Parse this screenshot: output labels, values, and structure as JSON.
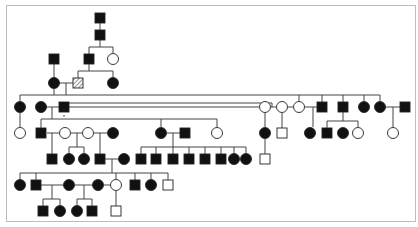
{
  "diagram": {
    "type": "pedigree",
    "colors": {
      "affected": "#111111",
      "unaffected_fill": "#ffffff",
      "line": "#444444",
      "frame": "#bdbdbd",
      "carrier_hatch": "#777777"
    },
    "legend_marker": "*",
    "individuals": [
      {
        "id": "a1",
        "shape": "square",
        "status": "affected",
        "x": 100,
        "y": 18
      },
      {
        "id": "a2",
        "shape": "square",
        "status": "affected",
        "x": 100,
        "y": 35
      },
      {
        "id": "b1",
        "shape": "square",
        "status": "affected",
        "x": 54,
        "y": 59
      },
      {
        "id": "b2",
        "shape": "square",
        "status": "affected",
        "x": 89,
        "y": 59
      },
      {
        "id": "b3",
        "shape": "circle",
        "status": "unaffected",
        "x": 113,
        "y": 59
      },
      {
        "id": "c1",
        "shape": "circle",
        "status": "affected",
        "x": 54,
        "y": 83
      },
      {
        "id": "c2",
        "shape": "square",
        "status": "carrier",
        "x": 78,
        "y": 83
      },
      {
        "id": "c3",
        "shape": "circle",
        "status": "affected",
        "x": 113,
        "y": 83
      },
      {
        "id": "d1",
        "shape": "circle",
        "status": "affected",
        "x": 20,
        "y": 107
      },
      {
        "id": "d2",
        "shape": "circle",
        "status": "affected",
        "x": 41,
        "y": 107
      },
      {
        "id": "d3",
        "shape": "square",
        "status": "affected",
        "x": 64,
        "y": 107,
        "marker": "*"
      },
      {
        "id": "d4",
        "shape": "circle",
        "status": "unaffected",
        "x": 265,
        "y": 107
      },
      {
        "id": "d5",
        "shape": "circle",
        "status": "unaffected",
        "x": 282,
        "y": 107
      },
      {
        "id": "d6",
        "shape": "circle",
        "status": "unaffected",
        "x": 299,
        "y": 107
      },
      {
        "id": "d7",
        "shape": "square",
        "status": "affected",
        "x": 322,
        "y": 107
      },
      {
        "id": "d8",
        "shape": "square",
        "status": "affected",
        "x": 343,
        "y": 107
      },
      {
        "id": "d9",
        "shape": "circle",
        "status": "affected",
        "x": 364,
        "y": 107
      },
      {
        "id": "d10",
        "shape": "circle",
        "status": "affected",
        "x": 380,
        "y": 107
      },
      {
        "id": "d11",
        "shape": "square",
        "status": "affected",
        "x": 405,
        "y": 107
      },
      {
        "id": "e1",
        "shape": "circle",
        "status": "unaffected",
        "x": 20,
        "y": 133
      },
      {
        "id": "e2",
        "shape": "square",
        "status": "affected",
        "x": 41,
        "y": 133
      },
      {
        "id": "e3",
        "shape": "circle",
        "status": "unaffected",
        "x": 65,
        "y": 133
      },
      {
        "id": "e4",
        "shape": "circle",
        "status": "unaffected",
        "x": 88,
        "y": 133
      },
      {
        "id": "e5",
        "shape": "circle",
        "status": "affected",
        "x": 113,
        "y": 133
      },
      {
        "id": "e6",
        "shape": "circle",
        "status": "affected",
        "x": 161,
        "y": 133
      },
      {
        "id": "e7",
        "shape": "square",
        "status": "affected",
        "x": 185,
        "y": 133
      },
      {
        "id": "e8",
        "shape": "circle",
        "status": "unaffected",
        "x": 217,
        "y": 133
      },
      {
        "id": "e9",
        "shape": "circle",
        "status": "affected",
        "x": 265,
        "y": 133
      },
      {
        "id": "e10",
        "shape": "square",
        "status": "unaffected",
        "x": 282,
        "y": 133
      },
      {
        "id": "e11",
        "shape": "circle",
        "status": "affected",
        "x": 310,
        "y": 133
      },
      {
        "id": "e12",
        "shape": "square",
        "status": "affected",
        "x": 327,
        "y": 133
      },
      {
        "id": "e13",
        "shape": "circle",
        "status": "affected",
        "x": 343,
        "y": 133
      },
      {
        "id": "e14",
        "shape": "circle",
        "status": "unaffected",
        "x": 358,
        "y": 133
      },
      {
        "id": "e15",
        "shape": "circle",
        "status": "unaffected",
        "x": 393,
        "y": 133
      },
      {
        "id": "f1",
        "shape": "square",
        "status": "affected",
        "x": 52,
        "y": 159
      },
      {
        "id": "f2",
        "shape": "circle",
        "status": "affected",
        "x": 69,
        "y": 159
      },
      {
        "id": "f3",
        "shape": "circle",
        "status": "affected",
        "x": 84,
        "y": 159
      },
      {
        "id": "f4",
        "shape": "square",
        "status": "affected",
        "x": 100,
        "y": 159
      },
      {
        "id": "f5",
        "shape": "circle",
        "status": "affected",
        "x": 124,
        "y": 159
      },
      {
        "id": "f6",
        "shape": "square",
        "status": "affected",
        "x": 141,
        "y": 159
      },
      {
        "id": "f7",
        "shape": "square",
        "status": "affected",
        "x": 156,
        "y": 159
      },
      {
        "id": "f8",
        "shape": "square",
        "status": "affected",
        "x": 173,
        "y": 159
      },
      {
        "id": "f9",
        "shape": "square",
        "status": "affected",
        "x": 189,
        "y": 159
      },
      {
        "id": "f10",
        "shape": "square",
        "status": "affected",
        "x": 205,
        "y": 159
      },
      {
        "id": "f11",
        "shape": "square",
        "status": "affected",
        "x": 221,
        "y": 159
      },
      {
        "id": "f12",
        "shape": "circle",
        "status": "affected",
        "x": 234,
        "y": 159
      },
      {
        "id": "f13",
        "shape": "circle",
        "status": "affected",
        "x": 246,
        "y": 159
      },
      {
        "id": "f14",
        "shape": "square",
        "status": "unaffected",
        "x": 265,
        "y": 159
      },
      {
        "id": "g1",
        "shape": "circle",
        "status": "affected",
        "x": 20,
        "y": 185
      },
      {
        "id": "g2",
        "shape": "square",
        "status": "affected",
        "x": 36,
        "y": 185
      },
      {
        "id": "g3",
        "shape": "circle",
        "status": "affected",
        "x": 69,
        "y": 185
      },
      {
        "id": "g4",
        "shape": "circle",
        "status": "affected",
        "x": 98,
        "y": 185
      },
      {
        "id": "g5",
        "shape": "circle",
        "status": "unaffected",
        "x": 116,
        "y": 185
      },
      {
        "id": "g6",
        "shape": "square",
        "status": "affected",
        "x": 135,
        "y": 185
      },
      {
        "id": "g7",
        "shape": "circle",
        "status": "affected",
        "x": 151,
        "y": 185
      },
      {
        "id": "g8",
        "shape": "square",
        "status": "unaffected",
        "x": 168,
        "y": 185
      },
      {
        "id": "h1",
        "shape": "square",
        "status": "affected",
        "x": 43,
        "y": 211
      },
      {
        "id": "h2",
        "shape": "circle",
        "status": "affected",
        "x": 60,
        "y": 211
      },
      {
        "id": "h3",
        "shape": "circle",
        "status": "affected",
        "x": 77,
        "y": 211
      },
      {
        "id": "h4",
        "shape": "square",
        "status": "affected",
        "x": 92,
        "y": 211
      },
      {
        "id": "h5",
        "shape": "square",
        "status": "unaffected",
        "x": 116,
        "y": 211
      }
    ],
    "lines": [
      [
        100,
        18,
        100,
        35
      ],
      [
        100,
        35,
        100,
        47
      ],
      [
        89,
        47,
        113,
        47
      ],
      [
        89,
        47,
        89,
        59
      ],
      [
        113,
        47,
        113,
        53
      ],
      [
        54,
        59,
        54,
        83
      ],
      [
        89,
        59,
        89,
        71
      ],
      [
        78,
        71,
        113,
        71
      ],
      [
        78,
        71,
        78,
        83
      ],
      [
        113,
        71,
        113,
        77
      ],
      [
        54,
        83,
        78,
        83
      ],
      [
        66,
        83,
        66,
        95
      ],
      [
        20,
        95,
        380,
        95
      ],
      [
        20,
        95,
        20,
        101
      ],
      [
        54,
        89,
        54,
        95
      ],
      [
        380,
        95,
        380,
        101
      ],
      [
        41,
        107,
        64,
        107
      ],
      [
        52,
        107,
        52,
        119
      ],
      [
        64,
        107,
        64,
        103
      ],
      [
        64,
        103,
        272,
        103
      ],
      [
        272,
        103,
        272,
        107
      ],
      [
        64,
        107,
        259,
        107
      ],
      [
        271,
        107,
        276,
        107
      ],
      [
        288,
        107,
        293,
        107
      ],
      [
        299,
        95,
        299,
        101
      ],
      [
        322,
        95,
        322,
        107
      ],
      [
        343,
        95,
        343,
        107
      ],
      [
        364,
        95,
        364,
        101
      ],
      [
        305,
        107,
        322,
        107
      ],
      [
        386,
        107,
        405,
        107
      ],
      [
        41,
        119,
        217,
        119
      ],
      [
        41,
        119,
        41,
        133
      ],
      [
        161,
        119,
        161,
        127
      ],
      [
        217,
        119,
        217,
        127
      ],
      [
        20,
        113,
        20,
        127
      ],
      [
        265,
        113,
        265,
        127
      ],
      [
        282,
        113,
        282,
        133
      ],
      [
        313,
        107,
        313,
        127
      ],
      [
        343,
        107,
        343,
        121
      ],
      [
        327,
        121,
        358,
        121
      ],
      [
        327,
        121,
        327,
        133
      ],
      [
        358,
        121,
        358,
        127
      ],
      [
        393,
        107,
        393,
        127
      ],
      [
        47,
        133,
        59,
        133
      ],
      [
        71,
        133,
        82,
        133
      ],
      [
        94,
        133,
        107,
        133
      ],
      [
        52,
        133,
        52,
        159
      ],
      [
        77,
        133,
        77,
        147
      ],
      [
        69,
        147,
        84,
        147
      ],
      [
        69,
        147,
        69,
        153
      ],
      [
        84,
        147,
        84,
        153
      ],
      [
        100,
        133,
        100,
        159
      ],
      [
        100,
        159,
        118,
        159
      ],
      [
        167,
        133,
        185,
        133
      ],
      [
        173,
        133,
        173,
        147
      ],
      [
        141,
        147,
        246,
        147
      ],
      [
        141,
        147,
        141,
        159
      ],
      [
        156,
        147,
        156,
        159
      ],
      [
        173,
        147,
        173,
        159
      ],
      [
        189,
        147,
        189,
        159
      ],
      [
        205,
        147,
        205,
        159
      ],
      [
        221,
        147,
        221,
        159
      ],
      [
        234,
        147,
        234,
        153
      ],
      [
        246,
        147,
        246,
        153
      ],
      [
        265,
        139,
        265,
        159
      ],
      [
        112,
        159,
        112,
        173
      ],
      [
        20,
        173,
        168,
        173
      ],
      [
        20,
        173,
        20,
        179
      ],
      [
        36,
        173,
        36,
        185
      ],
      [
        116,
        173,
        116,
        179
      ],
      [
        135,
        173,
        135,
        185
      ],
      [
        151,
        173,
        151,
        179
      ],
      [
        168,
        173,
        168,
        185
      ],
      [
        36,
        185,
        63,
        185
      ],
      [
        75,
        185,
        92,
        185
      ],
      [
        104,
        185,
        110,
        185
      ],
      [
        52,
        185,
        52,
        199
      ],
      [
        43,
        199,
        60,
        199
      ],
      [
        43,
        199,
        43,
        211
      ],
      [
        60,
        199,
        60,
        205
      ],
      [
        84,
        185,
        84,
        199
      ],
      [
        77,
        199,
        92,
        199
      ],
      [
        77,
        199,
        77,
        205
      ],
      [
        92,
        199,
        92,
        211
      ],
      [
        116,
        191,
        116,
        211
      ]
    ]
  }
}
